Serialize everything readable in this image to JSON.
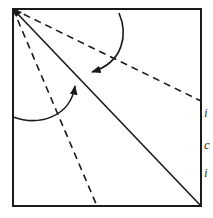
{
  "diagram": {
    "type": "origami-fold-diagram",
    "stroke_color": "#1a1a1a",
    "background": "#ffffff",
    "square": {
      "x": 13,
      "y": 9,
      "width": 188,
      "height": 197
    },
    "apex": {
      "x": 13,
      "y": 9
    },
    "lines": [
      {
        "id": "diagonal",
        "style": "solid",
        "from": [
          13,
          9
        ],
        "to": [
          201,
          206
        ]
      },
      {
        "id": "fold-to-right-edge",
        "style": "dashed",
        "from": [
          13,
          9
        ],
        "to": [
          201,
          101
        ]
      },
      {
        "id": "fold-to-bottom-edge",
        "style": "dashed",
        "from": [
          13,
          9
        ],
        "to": [
          97,
          206
        ]
      }
    ],
    "arrows": [
      {
        "id": "top-fold-arrow",
        "direction": "fold top edge down to diagonal",
        "start": [
          119,
          13
        ],
        "end": [
          90,
          73
        ]
      },
      {
        "id": "left-fold-arrow",
        "direction": "fold left edge over to diagonal",
        "start": [
          13,
          117
        ],
        "end": [
          75,
          84
        ]
      }
    ]
  },
  "clipped_text": [
    "i",
    "c",
    "i"
  ]
}
